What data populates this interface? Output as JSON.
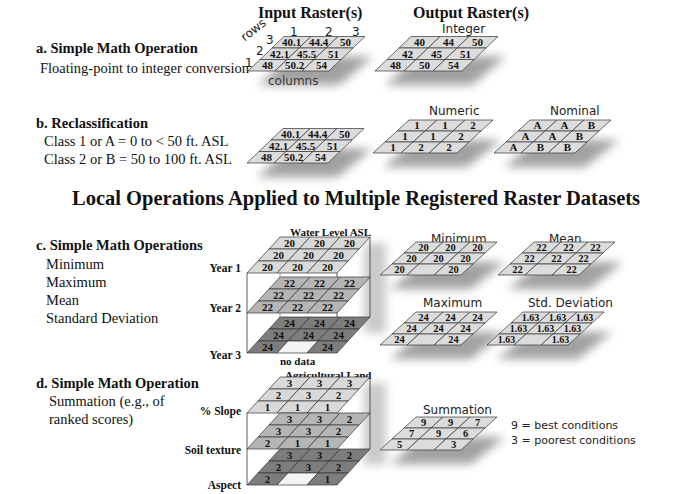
{
  "headers": {
    "input": "Input Raster(s)",
    "output": "Output Raster(s)"
  },
  "section_a": {
    "title": "a. Simple Math Operation",
    "lines": [
      "Floating-point to integer conversion"
    ],
    "axis": {
      "rows_label": "rows",
      "columns_label": "columns",
      "row_numbers": [
        "3",
        "2",
        "1"
      ],
      "col_numbers": [
        "1",
        "2",
        "3"
      ]
    },
    "input_grid": [
      [
        "40.1",
        "44.4",
        "50"
      ],
      [
        "42.1",
        "45.5",
        "51"
      ],
      [
        "48",
        "50.2",
        "54"
      ]
    ],
    "output_label": "Integer",
    "output_grid": [
      [
        "40",
        "44",
        "50"
      ],
      [
        "42",
        "45",
        "51"
      ],
      [
        "48",
        "50",
        "54"
      ]
    ]
  },
  "section_b": {
    "title": "b. Reclassification",
    "lines": [
      "Class 1 or A =   0 to < 50 ft. ASL",
      "Class 2 or B = 50 to 100 ft. ASL"
    ],
    "input_grid": [
      [
        "40.1",
        "44.4",
        "50"
      ],
      [
        "42.1",
        "45.5",
        "51"
      ],
      [
        "48",
        "50.2",
        "54"
      ]
    ],
    "numeric_label": "Numeric",
    "numeric_grid": [
      [
        "1",
        "1",
        "2"
      ],
      [
        "1",
        "1",
        "2"
      ],
      [
        "1",
        "2",
        "2"
      ]
    ],
    "nominal_label": "Nominal",
    "nominal_grid": [
      [
        "A",
        "A",
        "B"
      ],
      [
        "A",
        "A",
        "B"
      ],
      [
        "A",
        "B",
        "B"
      ]
    ]
  },
  "main_title": "Local Operations Applied to Multiple Registered Raster Datasets",
  "section_c": {
    "title": "c. Simple Math Operations",
    "lines": [
      "Minimum",
      "Maximum",
      "Mean",
      "Standard Deviation"
    ],
    "stack_label": "Water Level ASL",
    "layers": [
      {
        "label": "Year 1",
        "grid": [
          [
            "20",
            "20",
            "20"
          ],
          [
            "20",
            "20",
            "20"
          ],
          [
            "20",
            "20",
            "20"
          ]
        ],
        "fill": "#d9d9d9"
      },
      {
        "label": "Year 2",
        "grid": [
          [
            "22",
            "22",
            "22"
          ],
          [
            "22",
            "22",
            "22"
          ],
          [
            "22",
            "22",
            "22"
          ]
        ],
        "fill": "#b5b5b5"
      },
      {
        "label": "Year 3",
        "grid": [
          [
            "24",
            "24",
            "24"
          ],
          [
            "24",
            "24",
            "24"
          ],
          [
            "24",
            "",
            "24"
          ]
        ],
        "fill": "#7d7d7d",
        "nodata_cell": [
          2,
          1
        ]
      }
    ],
    "nodata_label": "no data",
    "outputs": [
      {
        "label": "Minimum",
        "grid": [
          [
            "20",
            "20",
            "20"
          ],
          [
            "20",
            "20",
            "20"
          ],
          [
            "20",
            "",
            "20"
          ]
        ]
      },
      {
        "label": "Mean",
        "grid": [
          [
            "22",
            "22",
            "22"
          ],
          [
            "22",
            "22",
            "22"
          ],
          [
            "22",
            "",
            "22"
          ]
        ]
      },
      {
        "label": "Maximum",
        "grid": [
          [
            "24",
            "24",
            "24"
          ],
          [
            "24",
            "24",
            "24"
          ],
          [
            "24",
            "",
            "24"
          ]
        ]
      },
      {
        "label": "Std. Deviation",
        "grid": [
          [
            "1.63",
            "1.63",
            "1.63"
          ],
          [
            "1.63",
            "1.63",
            "1.63"
          ],
          [
            "1.63",
            "",
            "1.63"
          ]
        ]
      }
    ]
  },
  "section_d": {
    "title": "d. Simple Math Operation",
    "lines": [
      "Summation (e.g., of",
      "ranked scores)"
    ],
    "stack_label": "Agricultural Land",
    "layers": [
      {
        "label": "% Slope",
        "grid": [
          [
            "3",
            "3",
            "3"
          ],
          [
            "2",
            "3",
            "2"
          ],
          [
            "1",
            "1",
            "1"
          ]
        ],
        "fill": "#d9d9d9"
      },
      {
        "label": "Soil texture",
        "grid": [
          [
            "3",
            "3",
            "2"
          ],
          [
            "3",
            "3",
            "2"
          ],
          [
            "2",
            "1",
            "1"
          ]
        ],
        "fill": "#b5b5b5"
      },
      {
        "label": "Aspect",
        "grid": [
          [
            "3",
            "3",
            "2"
          ],
          [
            "2",
            "3",
            "2"
          ],
          [
            "2",
            "",
            "1"
          ]
        ],
        "fill": "#7d7d7d",
        "nodata_cell": [
          2,
          1
        ]
      }
    ],
    "output": {
      "label": "Summation",
      "grid": [
        [
          "9",
          "9",
          "7"
        ],
        [
          "7",
          "9",
          "6"
        ],
        [
          "5",
          "",
          "3"
        ]
      ]
    },
    "legend": [
      "9 = best conditions",
      "3 = poorest conditions"
    ]
  },
  "colors": {
    "cell_fill": "#dcdcdc",
    "cell_stroke": "#333333",
    "shadow": "#555555",
    "layer2": "#b5b5b5",
    "layer3": "#7d7d7d",
    "nodata": "#f4f4f4"
  }
}
